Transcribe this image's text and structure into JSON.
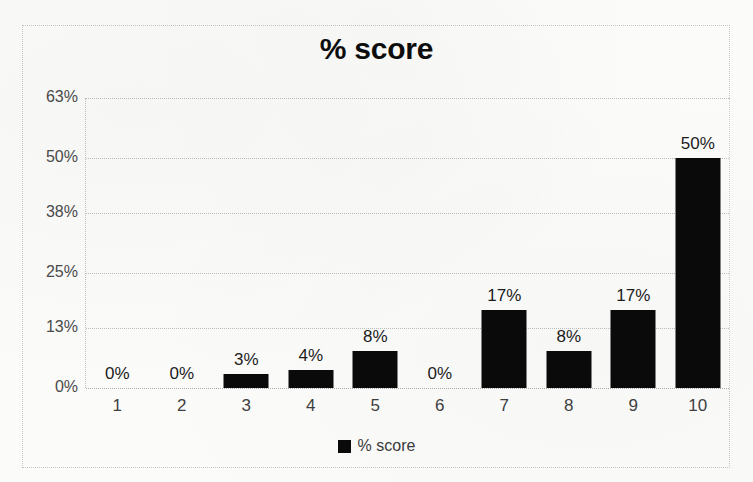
{
  "chart_data": {
    "type": "bar",
    "title": "% score",
    "xlabel": "",
    "ylabel": "",
    "categories": [
      "1",
      "2",
      "3",
      "4",
      "5",
      "6",
      "7",
      "8",
      "9",
      "10"
    ],
    "values": [
      0,
      0,
      3,
      4,
      8,
      0,
      17,
      8,
      17,
      50
    ],
    "data_labels": [
      "0%",
      "0%",
      "3%",
      "4%",
      "8%",
      "0%",
      "17%",
      "8%",
      "17%",
      "50%"
    ],
    "ylim": [
      0,
      63
    ],
    "ytick_values": [
      0,
      13,
      25,
      38,
      50,
      63
    ],
    "ytick_labels": [
      "0%",
      "13%",
      "25%",
      "38%",
      "50%",
      "63%"
    ],
    "grid": true,
    "legend": {
      "position": "bottom",
      "entries": [
        {
          "name": "% score",
          "color": "#0a0a0a"
        }
      ]
    },
    "series": [
      {
        "name": "% score",
        "color": "#0a0a0a",
        "values": [
          0,
          0,
          3,
          4,
          8,
          0,
          17,
          8,
          17,
          50
        ]
      }
    ]
  },
  "colors": {
    "bar": "#0a0a0a",
    "background": "#fbfbfa",
    "gridline": "#bdbdbd",
    "frame": "#c3c3c3",
    "tick_text": "#4a4a4a",
    "title_text": "#0d0d0d"
  }
}
